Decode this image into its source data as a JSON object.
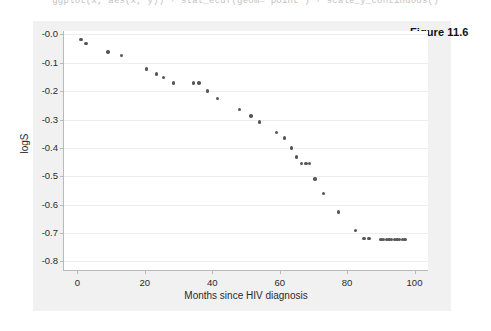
{
  "code_line": "ggplot(x, aes(x, y)) + stat_ecdf(geom=\"point\") + scale_y_continuous()",
  "figure_caption": "Figure 11.6",
  "chart_data": {
    "type": "scatter",
    "title": "",
    "xlabel": "Months since HIV diagnosis",
    "ylabel": "logS",
    "xlim": [
      -4,
      104
    ],
    "ylim": [
      -0.83,
      0.012
    ],
    "xticks": [
      0,
      20,
      40,
      60,
      80,
      100
    ],
    "yticks": [
      -0.0,
      -0.1,
      -0.2,
      -0.3,
      -0.4,
      -0.5,
      -0.6,
      -0.7,
      -0.8
    ],
    "xticklabels": [
      "0",
      "20",
      "40",
      "60",
      "80",
      "100"
    ],
    "yticklabels": [
      "-0.0",
      "-0.1",
      "-0.2",
      "-0.3",
      "-0.4",
      "-0.5",
      "-0.6",
      "-0.7",
      "-0.8"
    ],
    "grid": true,
    "grid_axis": "y",
    "legend": false,
    "marker_color": "#55555c",
    "marker_size": 3.4,
    "series": [
      {
        "name": "logS",
        "points": [
          [
            1.0,
            -0.018
          ],
          [
            2.5,
            -0.032
          ],
          [
            9.0,
            -0.062
          ],
          [
            13.0,
            -0.075
          ],
          [
            20.5,
            -0.122
          ],
          [
            23.5,
            -0.14
          ],
          [
            25.5,
            -0.152
          ],
          [
            28.5,
            -0.171
          ],
          [
            34.5,
            -0.171
          ],
          [
            36.0,
            -0.171
          ],
          [
            38.5,
            -0.199
          ],
          [
            41.5,
            -0.226
          ],
          [
            48.0,
            -0.265
          ],
          [
            51.5,
            -0.287
          ],
          [
            54.0,
            -0.308
          ],
          [
            59.0,
            -0.345
          ],
          [
            61.5,
            -0.365
          ],
          [
            63.5,
            -0.4
          ],
          [
            65.0,
            -0.432
          ],
          [
            66.5,
            -0.454
          ],
          [
            67.8,
            -0.454
          ],
          [
            68.8,
            -0.454
          ],
          [
            70.5,
            -0.51
          ],
          [
            73.0,
            -0.56
          ],
          [
            77.5,
            -0.625
          ],
          [
            82.5,
            -0.69
          ],
          [
            85.0,
            -0.72
          ],
          [
            86.5,
            -0.72
          ],
          [
            90.0,
            -0.722
          ],
          [
            90.8,
            -0.722
          ],
          [
            91.6,
            -0.722
          ],
          [
            92.4,
            -0.722
          ],
          [
            93.2,
            -0.722
          ],
          [
            94.0,
            -0.722
          ],
          [
            94.8,
            -0.722
          ],
          [
            95.6,
            -0.722
          ],
          [
            96.4,
            -0.722
          ],
          [
            97.2,
            -0.722
          ]
        ]
      }
    ]
  }
}
